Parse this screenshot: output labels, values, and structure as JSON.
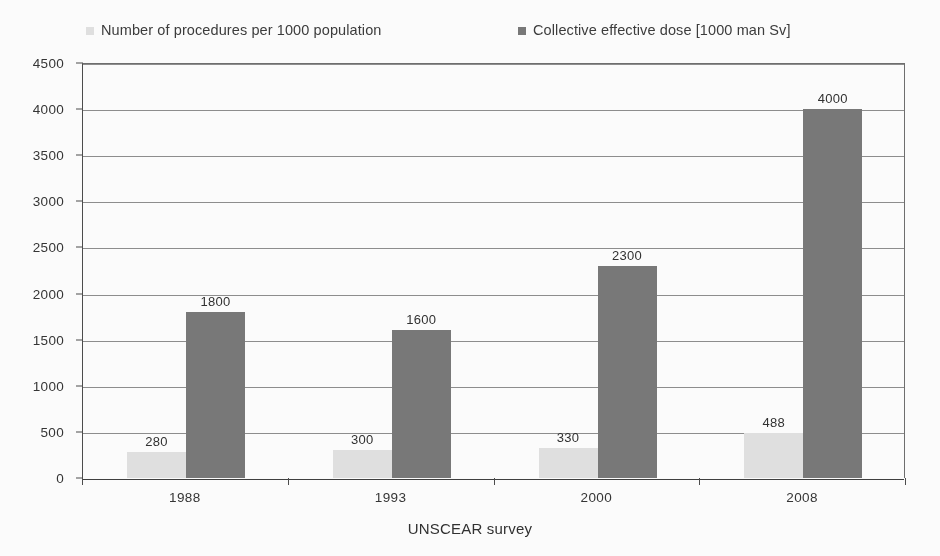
{
  "chart_data": {
    "type": "bar",
    "title": "",
    "xlabel": "UNSCEAR survey",
    "ylabel": "",
    "categories": [
      "1988",
      "1993",
      "2000",
      "2008"
    ],
    "series": [
      {
        "name": "Number of procedures per 1000 population",
        "color": "#e2e2e2",
        "values": [
          280,
          300,
          330,
          488
        ]
      },
      {
        "name": "Collective effective dose [1000 man Sv]",
        "color": "#787878",
        "values": [
          1800,
          1600,
          2300,
          4000
        ]
      }
    ],
    "ylim": [
      0,
      4500
    ],
    "ytick_step": 500,
    "yticks": [
      "4500",
      "4000",
      "3500",
      "3000",
      "2500",
      "2000",
      "1500",
      "1000",
      "500",
      "0"
    ],
    "grid": true,
    "legend_position": "top",
    "data_labels": true
  },
  "legend": {
    "items": [
      {
        "label": "Number of procedures per 1000 population",
        "marker": "legend-swatch-light"
      },
      {
        "label": "Collective effective dose [1000 man Sv]",
        "marker": "legend-swatch-dark"
      }
    ]
  },
  "axis": {
    "x_title": "UNSCEAR survey"
  }
}
